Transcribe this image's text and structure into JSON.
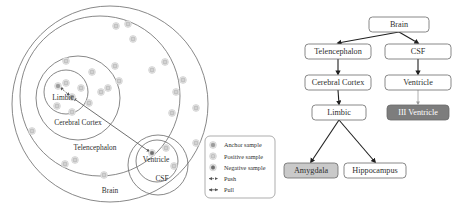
{
  "figure": {
    "left_panel": {
      "name": "hierarchical-embedding-space",
      "region_labels": [
        {
          "id": "limbic",
          "text": "Limbic",
          "x": 63,
          "y": 100
        },
        {
          "id": "cerebral-cortex",
          "text": "Cerebral Cortex",
          "x": 78,
          "y": 125
        },
        {
          "id": "telencephalon",
          "text": "Telencephalon",
          "x": 95,
          "y": 150
        },
        {
          "id": "ventricle",
          "text": "Ventricle",
          "x": 156,
          "y": 162
        },
        {
          "id": "csf",
          "text": "CSF",
          "x": 162,
          "y": 181
        },
        {
          "id": "brain",
          "text": "Brain",
          "x": 110,
          "y": 193
        }
      ],
      "circles": [
        {
          "id": "brain-circle",
          "cx": 110,
          "cy": 104,
          "r": 98
        },
        {
          "id": "telencephalon-circle",
          "cx": 100,
          "cy": 96,
          "r": 80
        },
        {
          "id": "cerebral-cortex-circle",
          "cx": 78,
          "cy": 98,
          "r": 42
        },
        {
          "id": "limbic-circle",
          "cx": 66,
          "cy": 92,
          "r": 22
        },
        {
          "id": "csf-circle",
          "cx": 158,
          "cy": 165,
          "r": 30
        },
        {
          "id": "ventricle-circle",
          "cx": 157,
          "cy": 161,
          "r": 21
        }
      ],
      "samples": [
        {
          "type": "anchor",
          "cx": 58,
          "cy": 86
        },
        {
          "type": "anchor",
          "cx": 72,
          "cy": 97
        },
        {
          "type": "negative",
          "cx": 152,
          "cy": 153
        },
        {
          "type": "positive",
          "cx": 66,
          "cy": 83
        },
        {
          "type": "positive",
          "cx": 81,
          "cy": 88
        },
        {
          "type": "positive",
          "cx": 89,
          "cy": 103
        },
        {
          "type": "positive",
          "cx": 72,
          "cy": 112
        },
        {
          "type": "positive",
          "cx": 57,
          "cy": 106
        },
        {
          "type": "positive",
          "cx": 101,
          "cy": 92
        },
        {
          "type": "positive",
          "cx": 66,
          "cy": 61
        },
        {
          "type": "positive",
          "cx": 92,
          "cy": 72
        },
        {
          "type": "positive",
          "cx": 115,
          "cy": 66
        },
        {
          "type": "positive",
          "cx": 119,
          "cy": 81
        },
        {
          "type": "positive",
          "cx": 108,
          "cy": 88
        },
        {
          "type": "positive",
          "cx": 116,
          "cy": 26
        },
        {
          "type": "positive",
          "cx": 128,
          "cy": 24
        },
        {
          "type": "positive",
          "cx": 133,
          "cy": 39
        },
        {
          "type": "positive",
          "cx": 152,
          "cy": 70
        },
        {
          "type": "positive",
          "cx": 165,
          "cy": 62
        },
        {
          "type": "positive",
          "cx": 183,
          "cy": 80
        },
        {
          "type": "positive",
          "cx": 176,
          "cy": 92
        },
        {
          "type": "positive",
          "cx": 172,
          "cy": 113
        },
        {
          "type": "positive",
          "cx": 196,
          "cy": 108
        },
        {
          "type": "positive",
          "cx": 32,
          "cy": 131
        },
        {
          "type": "positive",
          "cx": 65,
          "cy": 164
        },
        {
          "type": "positive",
          "cx": 75,
          "cy": 160
        },
        {
          "type": "positive",
          "cx": 104,
          "cy": 175
        },
        {
          "type": "positive",
          "cx": 166,
          "cy": 148
        },
        {
          "type": "positive",
          "cx": 174,
          "cy": 166
        },
        {
          "type": "positive",
          "cx": 196,
          "cy": 143
        }
      ],
      "edges": [
        {
          "id": "push-edge",
          "kind": "push",
          "x1": 60,
          "y1": 87,
          "x2": 70,
          "y2": 96
        },
        {
          "id": "pull-edge",
          "kind": "pull",
          "x1": 73,
          "y1": 98,
          "x2": 150,
          "y2": 152
        }
      ]
    },
    "legend": {
      "name": "legend-box",
      "items": [
        {
          "id": "anchor-sample",
          "glyph": "anchor-dot",
          "label": "Anchor sample"
        },
        {
          "id": "positive-sample",
          "glyph": "positive-dot",
          "label": "Positive sample"
        },
        {
          "id": "negative-sample",
          "glyph": "negative-dot",
          "label": "Negative sample"
        },
        {
          "id": "push",
          "glyph": "dashed-arrow",
          "label": "Push"
        },
        {
          "id": "pull",
          "glyph": "solid-arrow",
          "label": "Pull"
        }
      ]
    },
    "flowchart": {
      "name": "brain-region-hierarchy",
      "nodes": [
        {
          "id": "brain",
          "label": "Brain",
          "x": 89,
          "y": 17,
          "w": 60,
          "h": 15,
          "fill": "white"
        },
        {
          "id": "telencephalon",
          "label": "Telencephalon",
          "x": 25,
          "y": 44,
          "w": 66,
          "h": 15,
          "fill": "white"
        },
        {
          "id": "csf",
          "label": "CSF",
          "x": 105,
          "y": 44,
          "w": 66,
          "h": 15,
          "fill": "white"
        },
        {
          "id": "cerebral-cortex",
          "label": "Cerebral Cortex",
          "x": 25,
          "y": 75,
          "w": 66,
          "h": 15,
          "fill": "white"
        },
        {
          "id": "ventricle",
          "label": "Ventricle",
          "x": 105,
          "y": 75,
          "w": 66,
          "h": 15,
          "fill": "white"
        },
        {
          "id": "limbic",
          "label": "Limbic",
          "x": 32,
          "y": 105,
          "w": 54,
          "h": 15,
          "fill": "white"
        },
        {
          "id": "iii-ventricle",
          "label": "III Ventricle",
          "x": 107,
          "y": 105,
          "w": 62,
          "h": 15,
          "fill": "dark"
        },
        {
          "id": "amygdala",
          "label": "Amygdala",
          "x": 4,
          "y": 163,
          "w": 54,
          "h": 15,
          "fill": "light"
        },
        {
          "id": "hippocampus",
          "label": "Hippocampus",
          "x": 64,
          "y": 163,
          "w": 62,
          "h": 15,
          "fill": "white"
        }
      ],
      "connections": [
        {
          "from": "brain",
          "to": "telencephalon",
          "style": "solid"
        },
        {
          "from": "brain",
          "to": "csf",
          "style": "solid"
        },
        {
          "from": "telencephalon",
          "to": "cerebral-cortex",
          "style": "solid"
        },
        {
          "from": "csf",
          "to": "ventricle",
          "style": "solid"
        },
        {
          "from": "cerebral-cortex",
          "to": "limbic",
          "style": "solid"
        },
        {
          "from": "ventricle",
          "to": "iii-ventricle",
          "style": "light"
        },
        {
          "from": "limbic",
          "to": "amygdala",
          "style": "solid"
        },
        {
          "from": "limbic",
          "to": "hippocampus",
          "style": "solid"
        }
      ]
    },
    "colors": {
      "anchor": "#9b9b9b",
      "positive": "#d2d2d2",
      "negative": "#6e6e6e",
      "stroke": "#6a6a6a",
      "node_dark": "#7d7d7d",
      "node_light": "#c9c9c9",
      "text": "#2f2f2f"
    }
  }
}
